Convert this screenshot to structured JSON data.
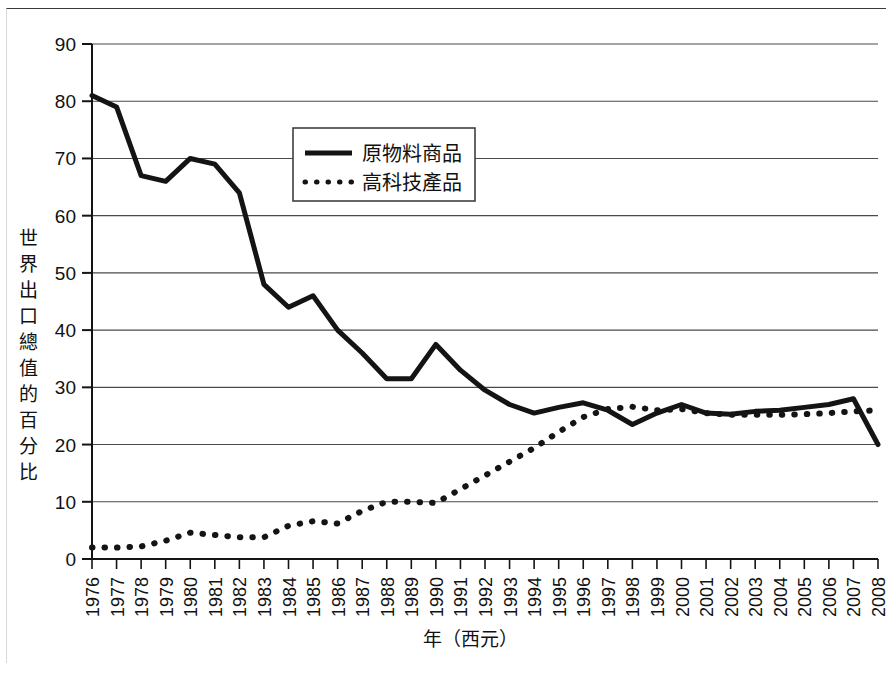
{
  "chart_data": {
    "type": "line",
    "title": "",
    "xlabel": "年（西元）",
    "ylabel": "世界出口總值的百分比",
    "xlim": [
      1976,
      2008
    ],
    "ylim": [
      0,
      90
    ],
    "ytick_step": 10,
    "grid": true,
    "legend_position": "upper-center",
    "categories": [
      "1976",
      "1977",
      "1978",
      "1979",
      "1980",
      "1981",
      "1982",
      "1983",
      "1984",
      "1985",
      "1986",
      "1987",
      "1988",
      "1989",
      "1990",
      "1991",
      "1992",
      "1993",
      "1994",
      "1995",
      "1996",
      "1997",
      "1998",
      "1999",
      "2000",
      "2001",
      "2002",
      "2003",
      "2004",
      "2005",
      "2006",
      "2007",
      "2008"
    ],
    "yticks": [
      "0",
      "10",
      "20",
      "30",
      "40",
      "50",
      "60",
      "70",
      "80",
      "90"
    ],
    "series": [
      {
        "name": "原物料商品",
        "style": "solid",
        "color": "#141414",
        "values": [
          81,
          79,
          67,
          66,
          70,
          69,
          64,
          48,
          44,
          46,
          40,
          36,
          31.5,
          31.5,
          37.5,
          33,
          29.5,
          27,
          25.5,
          26.5,
          27.3,
          26,
          23.5,
          25.5,
          27,
          25.5,
          25.3,
          25.8,
          26,
          26.5,
          27,
          28,
          20
        ]
      },
      {
        "name": "高科技產品",
        "style": "dotted",
        "color": "#141414",
        "values": [
          2,
          2,
          2.2,
          3.2,
          4.6,
          4.2,
          3.8,
          3.8,
          5.8,
          6.6,
          6.2,
          8.4,
          10,
          10,
          9.8,
          12.2,
          14.6,
          17,
          19.4,
          22.2,
          24.8,
          26.2,
          26.6,
          26,
          26.2,
          25.5,
          25.2,
          25.2,
          25.2,
          25.3,
          25.5,
          25.8,
          26
        ]
      }
    ]
  },
  "legend": {
    "entries": [
      {
        "label": "原物料商品",
        "marker": "solid-line"
      },
      {
        "label": "高科技產品",
        "marker": "dotted-line"
      }
    ]
  }
}
